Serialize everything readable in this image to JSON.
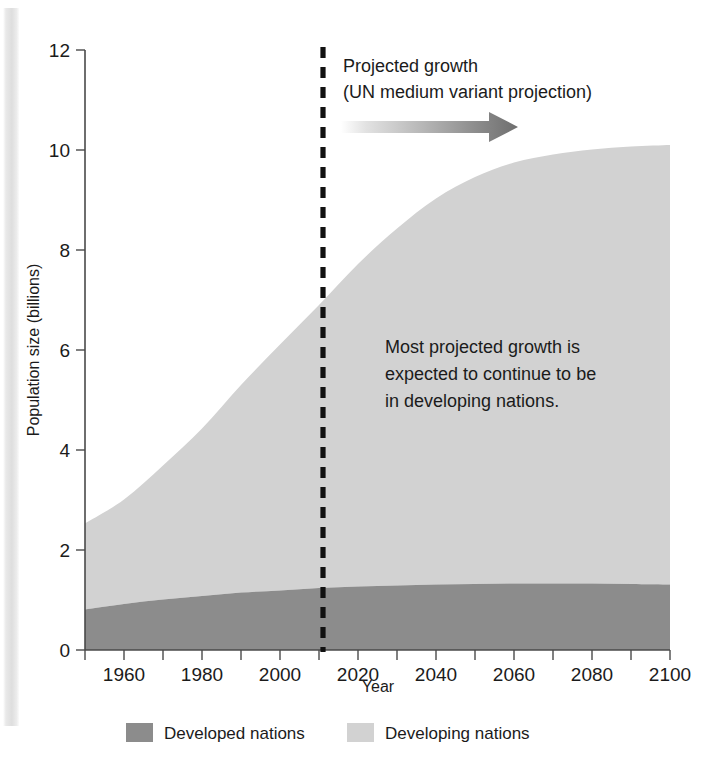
{
  "chart_data": {
    "type": "area",
    "stacked": true,
    "title": "",
    "xlabel": "Year",
    "ylabel": "Population size (billions)",
    "xlim": [
      1950,
      2100
    ],
    "ylim": [
      0,
      12
    ],
    "xticks": [
      1960,
      1980,
      2000,
      2020,
      2040,
      2060,
      2080,
      2100
    ],
    "xtick_labels": [
      "1960",
      "1980",
      "2000",
      "2020",
      "2040",
      "2060",
      "2080",
      "2100"
    ],
    "xminor_step": 10,
    "yticks": [
      0,
      2,
      4,
      6,
      8,
      10,
      12
    ],
    "ytick_labels": [
      "0",
      "2",
      "4",
      "6",
      "8",
      "10",
      "12"
    ],
    "grid": false,
    "legend_position": "bottom",
    "x": [
      1950,
      1960,
      1970,
      1980,
      1990,
      2000,
      2010,
      2020,
      2030,
      2040,
      2050,
      2060,
      2070,
      2080,
      2090,
      2100
    ],
    "series": [
      {
        "name": "Developed nations",
        "color": "#8c8c8c",
        "values": [
          0.81,
          0.92,
          1.01,
          1.08,
          1.15,
          1.19,
          1.24,
          1.27,
          1.29,
          1.31,
          1.32,
          1.33,
          1.33,
          1.33,
          1.32,
          1.31
        ]
      },
      {
        "name": "Developing nations",
        "color": "#d2d2d2",
        "values": [
          1.72,
          2.09,
          2.68,
          3.35,
          4.15,
          4.92,
          5.66,
          6.45,
          7.14,
          7.72,
          8.14,
          8.42,
          8.58,
          8.68,
          8.75,
          8.79
        ]
      }
    ],
    "totals": [
      2.53,
      3.01,
      3.69,
      4.43,
      5.3,
      6.11,
      6.9,
      7.72,
      8.43,
      9.03,
      9.46,
      9.75,
      9.91,
      10.01,
      10.07,
      10.1
    ],
    "annotations": [
      {
        "name": "projection-divider",
        "kind": "vertical-dashed-line",
        "x": 2010
      },
      {
        "name": "projected-growth-note",
        "kind": "text",
        "lines": [
          "Projected growth",
          "(UN medium variant projection)"
        ]
      },
      {
        "name": "projection-arrow",
        "kind": "gradient-arrow",
        "direction": "right"
      },
      {
        "name": "developing-growth-note",
        "kind": "text",
        "lines": [
          "Most projected growth is",
          "expected to continue to be",
          "in developing nations."
        ]
      }
    ]
  },
  "axes": {
    "y_title": "Population size (billions)",
    "x_title": "Year",
    "y_tick_labels": [
      "12",
      "10",
      "8",
      "6",
      "4",
      "2",
      "0"
    ],
    "x_tick_labels": [
      "1960",
      "1980",
      "2000",
      "2020",
      "2040",
      "2060",
      "2080",
      "2100"
    ]
  },
  "notes": {
    "projection_line1": "Projected growth",
    "projection_line2": "(UN medium variant projection)",
    "developing_line1": "Most projected growth is",
    "developing_line2": "expected to continue to be",
    "developing_line3": "in developing nations."
  },
  "legend": {
    "items": [
      {
        "label": "Developed nations",
        "color": "#8c8c8c"
      },
      {
        "label": "Developing nations",
        "color": "#d2d2d2"
      }
    ]
  },
  "colors": {
    "developed": "#8c8c8c",
    "developing": "#d2d2d2",
    "axis": "#4a4a4a",
    "text": "#1b1b1b",
    "divider": "#111111",
    "background": "#ffffff"
  }
}
